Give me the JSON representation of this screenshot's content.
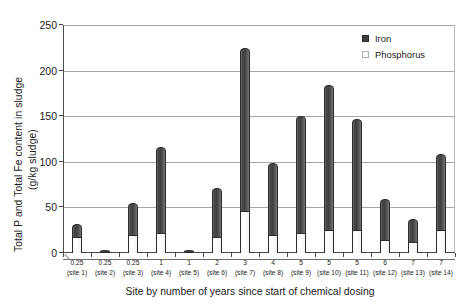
{
  "chart_data": {
    "type": "bar",
    "stacked": true,
    "title": "",
    "xlabel": "Site by number of years since start of chemical dosing",
    "ylabel": "Total P and Total Fe content in sludge (g/kg sludge)",
    "ylabel_line1": "Total P and Total Fe content in sludge",
    "ylabel_line2": "(g/kg sludge)",
    "ylim": [
      0,
      250
    ],
    "yticks": [
      0,
      50,
      100,
      150,
      200,
      250
    ],
    "ytick_labels": [
      "0",
      "50",
      "100",
      "150",
      "200",
      "250"
    ],
    "grid": "horizontal",
    "legend_position": "top-right",
    "categories": [
      "0.25 (site 1)",
      "0.25 (site 2)",
      "0.25 (site 3)",
      "1 (site 4)",
      "1 (site 5)",
      "2 (site 6)",
      "3 (site 7)",
      "4 (site 8)",
      "5 (site 9)",
      "5 (site 10)",
      "5 (site 11)",
      "6 (site 12)",
      "7 (site 13)",
      "7 (site 14)"
    ],
    "category_years": [
      "0.25",
      "0.25",
      "0.25",
      "1",
      "1",
      "2",
      "3",
      "4",
      "5",
      "5",
      "5",
      "6",
      "7",
      "7"
    ],
    "category_sites": [
      "(site 1)",
      "(site 2)",
      "(site 3)",
      "(site 4)",
      "(site 5)",
      "(site 6)",
      "(site 7)",
      "(site 8)",
      "(site 9)",
      "(site 10)",
      "(site 11)",
      "(site 12)",
      "(site 13)",
      "(site 14)"
    ],
    "series": [
      {
        "name": "Phosphorus",
        "color": "#ffffff",
        "values": [
          18,
          0,
          20,
          22,
          1,
          18,
          46,
          20,
          22,
          25,
          25,
          14,
          12,
          25
        ]
      },
      {
        "name": "Iron",
        "color": "#3f3f3f",
        "values": [
          14,
          0,
          35,
          94,
          0,
          53,
          179,
          79,
          128,
          159,
          122,
          45,
          25,
          84
        ]
      }
    ],
    "totals": [
      32,
      0,
      55,
      116,
      1,
      71,
      225,
      99,
      150,
      184,
      147,
      59,
      37,
      109
    ]
  },
  "legend": {
    "items": [
      {
        "label": "Iron",
        "swatch": "filled-dark-square"
      },
      {
        "label": "Phosphorus",
        "swatch": "open-light-square"
      }
    ]
  }
}
